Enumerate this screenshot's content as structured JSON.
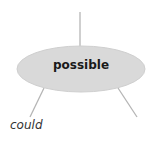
{
  "diagram": {
    "node": {
      "label": "possible",
      "fill": "#d9d9d9"
    },
    "edge_labels": [
      {
        "text": "could"
      }
    ],
    "line_color": "#b5b5b5"
  }
}
